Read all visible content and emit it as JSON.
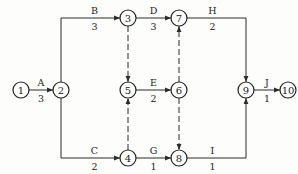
{
  "diagram": {
    "type": "activity-on-arrow network",
    "node_radius": 8,
    "colors": {
      "line": "#2b2b2b",
      "node_fill": "#ffffff",
      "text": "#1a1a1a"
    },
    "nodes": [
      {
        "id": "1",
        "label": "1",
        "x": 21,
        "y": 90
      },
      {
        "id": "2",
        "label": "2",
        "x": 61,
        "y": 90
      },
      {
        "id": "3",
        "label": "3",
        "x": 128,
        "y": 18
      },
      {
        "id": "4",
        "label": "4",
        "x": 128,
        "y": 158
      },
      {
        "id": "5",
        "label": "5",
        "x": 128,
        "y": 90
      },
      {
        "id": "6",
        "label": "6",
        "x": 179,
        "y": 90
      },
      {
        "id": "7",
        "label": "7",
        "x": 179,
        "y": 18
      },
      {
        "id": "8",
        "label": "8",
        "x": 179,
        "y": 158
      },
      {
        "id": "9",
        "label": "9",
        "x": 246,
        "y": 90
      },
      {
        "id": "10",
        "label": "10",
        "x": 288,
        "y": 90
      }
    ],
    "activities": [
      {
        "name": "A",
        "duration": "3",
        "from": "1",
        "to": "2",
        "dummy": false
      },
      {
        "name": "B",
        "duration": "3",
        "from": "2",
        "to": "3",
        "dummy": false
      },
      {
        "name": "C",
        "duration": "2",
        "from": "2",
        "to": "4",
        "dummy": false
      },
      {
        "name": "D",
        "duration": "3",
        "from": "3",
        "to": "7",
        "dummy": false
      },
      {
        "name": "E",
        "duration": "2",
        "from": "5",
        "to": "6",
        "dummy": false
      },
      {
        "name": "G",
        "duration": "1",
        "from": "4",
        "to": "8",
        "dummy": false
      },
      {
        "name": "H",
        "duration": "2",
        "from": "7",
        "to": "9",
        "dummy": false
      },
      {
        "name": "I",
        "duration": "1",
        "from": "8",
        "to": "9",
        "dummy": false
      },
      {
        "name": "J",
        "duration": "1",
        "from": "9",
        "to": "10",
        "dummy": false
      }
    ],
    "dummy_activities": [
      {
        "from": "3",
        "to": "5"
      },
      {
        "from": "4",
        "to": "5"
      },
      {
        "from": "6",
        "to": "7"
      },
      {
        "from": "6",
        "to": "8"
      }
    ]
  }
}
